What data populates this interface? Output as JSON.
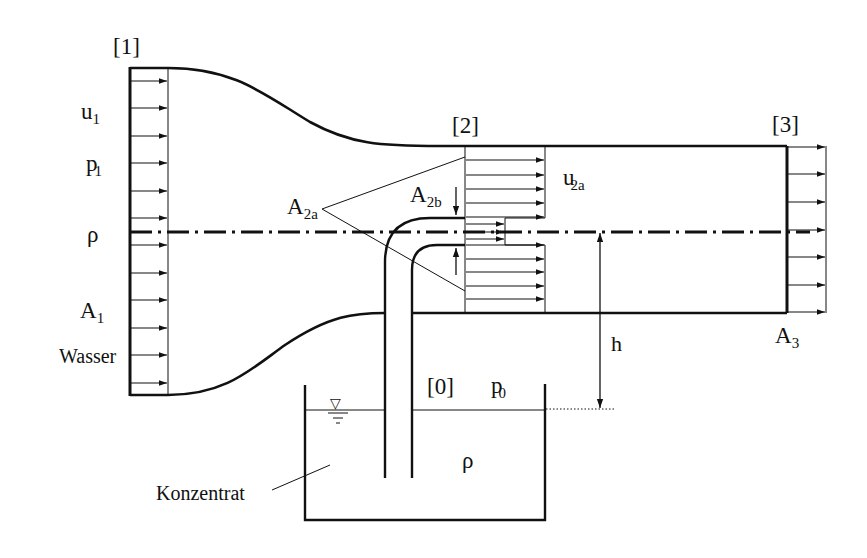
{
  "diagram": {
    "type": "venturi-jet-pump",
    "sections": {
      "s1": "[1]",
      "s2": "[2]",
      "s3": "[3]",
      "s0": "[0]"
    },
    "labels": {
      "u1_base": "u",
      "u1_sub": "1",
      "p1_base": "p",
      "p1_sub": "1",
      "rho_left": "ρ",
      "A1_base": "A",
      "A1_sub": "1",
      "wasser": "Wasser",
      "A2a_base": "A",
      "A2a_sub": "2a",
      "A2b_base": "A",
      "A2b_sub": "2b",
      "u2a_base": "u",
      "u2a_sub": "2a",
      "h": "h",
      "A3_base": "A",
      "A3_sub": "3",
      "p0_base": "p",
      "p0_sub": "0",
      "rho_tank": "ρ",
      "konzentrat": "Konzentrat",
      "water_level_symbol": "▽"
    },
    "colors": {
      "line": "#111111",
      "background": "#ffffff"
    }
  }
}
